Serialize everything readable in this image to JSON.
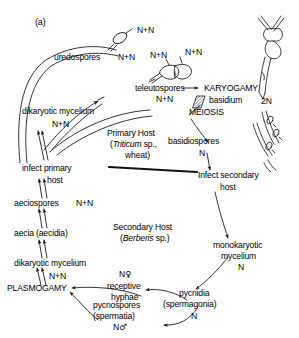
{
  "figure": {
    "panel_label": "(a)"
  },
  "hosts": {
    "primary": {
      "line1": "Primary Host",
      "line2_italic": "Triticum",
      "line2_rest": " sp.,",
      "line3": "wheat)",
      "line2_paren_open": "("
    },
    "secondary": {
      "line1": "Secondary Host",
      "paren_open": "(",
      "italic": "Berberis",
      "rest": " sp.)"
    }
  },
  "stages": {
    "uredospores": {
      "label": "uredospores",
      "nuclear": "N+N"
    },
    "uredospore_drawing_nuclear": "N+N",
    "teleutospores": {
      "label": "teleutospores",
      "nuclear": "N+N"
    },
    "teleutospore_cell1_nuclear": "N+N",
    "teleutospore_cell2_nuclear": "N+N",
    "karyogamy": "KARYOGAMY",
    "basidium": {
      "label": "basidium",
      "nuclear": "2N"
    },
    "meiosis": "MEIOSIS",
    "basidiospores": {
      "label": "basidiospores",
      "nuclear": "N"
    },
    "infect_secondary": {
      "line1": "Infect secondary",
      "line2": "host"
    },
    "monokaryotic_mycelium": {
      "line1": "monokaryotic",
      "line2": "mycelium",
      "nuclear": "N"
    },
    "pycnidia": {
      "line1": "pycnidia",
      "line2": "(spermagonia)",
      "nuclear": "N"
    },
    "receptive_hyphae": {
      "nuclear": "N",
      "sex_symbol": "♀",
      "line1": "receptive",
      "line2": "hyphae"
    },
    "pycnospores": {
      "line1": "pycnospores",
      "line2": "(spermatia)",
      "nuclear": "N",
      "sex_symbol": "♂"
    },
    "plasmogamy": "PLASMOGAMY",
    "dikaryotic_mycelium_secondary": {
      "label": "dikaryotic  mycelium",
      "nuclear": "N+N"
    },
    "aecia": "aecia (aecidia)",
    "aeciospores": {
      "label": "aeciospores",
      "nuclear": "N+N"
    },
    "infect_primary": {
      "line1": "infect primary",
      "line2": "host"
    },
    "dikaryotic_mycelium_primary": {
      "label": "dikaryotic mycelium",
      "nuclear": "N+N"
    }
  },
  "colors": {
    "ink": "#1a1a1a",
    "background": "#ffffff",
    "hatch": "#555555"
  }
}
